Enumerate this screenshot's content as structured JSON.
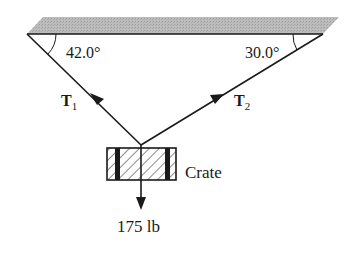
{
  "diagram": {
    "type": "free-body / statics diagram",
    "ceiling": {
      "fill_color": "#b5b5b5",
      "line_color": "#1a1a1a"
    },
    "angles": {
      "left": {
        "value": "42.0°"
      },
      "right": {
        "value": "30.0°"
      }
    },
    "tensions": {
      "t1": {
        "symbol": "T",
        "subscript": "1"
      },
      "t2": {
        "symbol": "T",
        "subscript": "2"
      }
    },
    "crate": {
      "label": "Crate"
    },
    "load": {
      "label": "175 lb"
    }
  }
}
